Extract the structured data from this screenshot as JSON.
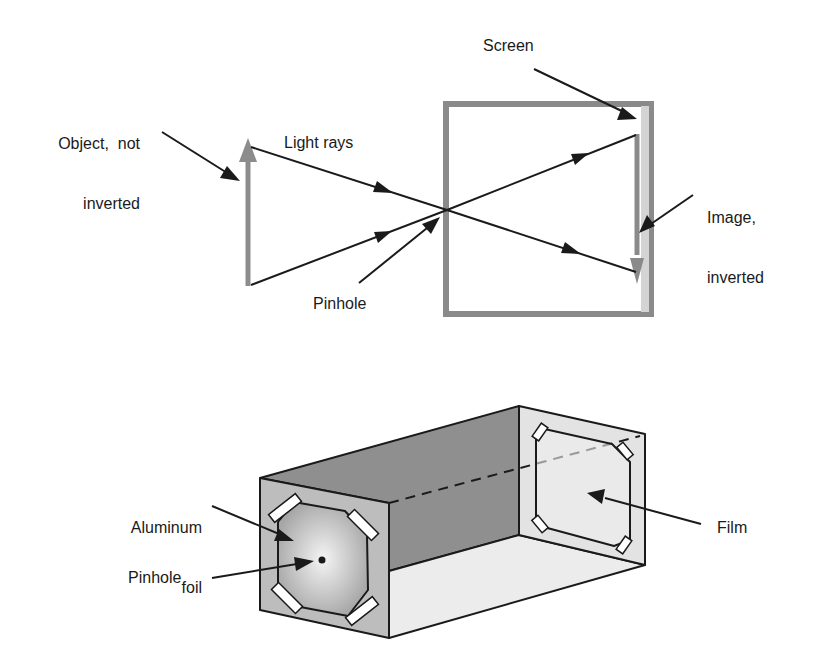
{
  "figure": {
    "top_panel": {
      "title": "Pinhole principle",
      "labels": {
        "object": [
          "Object,  not",
          "inverted"
        ],
        "light_rays": "Light rays",
        "pinhole": "Pinhole",
        "screen": "Screen",
        "image": [
          "Image,",
          "inverted"
        ]
      }
    },
    "bottom_panel": {
      "title": "Pinhole camera box",
      "labels": {
        "aluminum_foil": [
          "Aluminum",
          "foil"
        ],
        "pinhole": "Pinhole",
        "film": "Film"
      }
    },
    "colors": {
      "background": "#ffffff",
      "line": "#1a1a1a",
      "object_arrow": "#8c8c8c",
      "box_frame": "#8a8a8a",
      "screen_strip": "#d4d4d4",
      "image_arrow": "#8a8a8a",
      "box_top": "#8f8f8f",
      "box_front": "#bdbdbd",
      "box_bottom": "#ececec",
      "box_back": "#e3e3e3",
      "foil_center": "#f2f2f2",
      "foil_edge": "#a8a8a8"
    }
  }
}
